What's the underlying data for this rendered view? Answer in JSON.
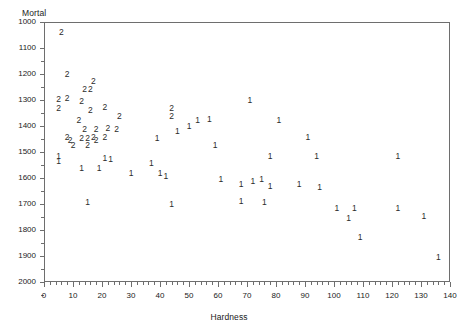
{
  "chart_data": {
    "type": "scatter",
    "title": "",
    "xlabel": "Hardness",
    "ylabel": "Mortal",
    "xlim": [
      0,
      140
    ],
    "ylim": [
      1000,
      2000
    ],
    "xticks": [
      0,
      10,
      20,
      30,
      40,
      50,
      60,
      70,
      80,
      90,
      100,
      110,
      120,
      130,
      140
    ],
    "yticks": [
      1000,
      1100,
      1200,
      1300,
      1400,
      1500,
      1600,
      1700,
      1800,
      1900,
      2000
    ],
    "grid": false,
    "legend": "none",
    "point_marker_mode": "group-digit-label",
    "series": [
      {
        "name": "2",
        "label": "2",
        "points": [
          [
            6,
            1960
          ],
          [
            8,
            1800
          ],
          [
            14,
            1742
          ],
          [
            17,
            1772
          ],
          [
            16,
            1742
          ],
          [
            5,
            1702
          ],
          [
            8,
            1709
          ],
          [
            13,
            1696
          ],
          [
            5,
            1668
          ],
          [
            16,
            1660
          ],
          [
            21,
            1673
          ],
          [
            44,
            1668
          ],
          [
            44,
            1640
          ],
          [
            12,
            1625
          ],
          [
            26,
            1640
          ],
          [
            14,
            1587
          ],
          [
            18,
            1589
          ],
          [
            22,
            1591
          ],
          [
            25,
            1587
          ],
          [
            8,
            1558
          ],
          [
            13,
            1555
          ],
          [
            17,
            1559
          ],
          [
            21,
            1558
          ],
          [
            9,
            1547
          ],
          [
            15,
            1555
          ],
          [
            18,
            1546
          ],
          [
            10,
            1527
          ],
          [
            15,
            1527
          ]
        ]
      },
      {
        "name": "1",
        "label": "1",
        "points": [
          [
            71,
            1700
          ],
          [
            50,
            1600
          ],
          [
            53,
            1625
          ],
          [
            57,
            1627
          ],
          [
            46,
            1580
          ],
          [
            81,
            1625
          ],
          [
            91,
            1558
          ],
          [
            122,
            1486
          ],
          [
            39,
            1555
          ],
          [
            59,
            1527
          ],
          [
            78,
            1485
          ],
          [
            94,
            1485
          ],
          [
            37,
            1456
          ],
          [
            21,
            1477
          ],
          [
            23,
            1475
          ],
          [
            5,
            1486
          ],
          [
            5,
            1466
          ],
          [
            19,
            1440
          ],
          [
            13,
            1440
          ],
          [
            30,
            1420
          ],
          [
            40,
            1420
          ],
          [
            42,
            1406
          ],
          [
            61,
            1395
          ],
          [
            68,
            1378
          ],
          [
            72,
            1387
          ],
          [
            75,
            1396
          ],
          [
            78,
            1369
          ],
          [
            88,
            1378
          ],
          [
            95,
            1365
          ],
          [
            15,
            1308
          ],
          [
            44,
            1300
          ],
          [
            68,
            1310
          ],
          [
            76,
            1306
          ],
          [
            101,
            1286
          ],
          [
            107,
            1285
          ],
          [
            122,
            1286
          ],
          [
            131,
            1254
          ],
          [
            105,
            1247
          ],
          [
            109,
            1175
          ],
          [
            136,
            1096
          ]
        ]
      }
    ]
  },
  "axes": {
    "y_title": "Mortal",
    "x_title": "Hardness",
    "y_tick_labels": [
      "2000",
      "1900",
      "1800",
      "1700",
      "1600",
      "1500",
      "1400",
      "1300",
      "1200",
      "1100",
      "1000"
    ],
    "x_tick_labels": [
      "0",
      "10",
      "20",
      "30",
      "40",
      "50",
      "60",
      "70",
      "80",
      "90",
      "100",
      "110",
      "120",
      "130",
      "140"
    ]
  },
  "colors": {
    "frame": "#6e6e6e",
    "text": "#1a1a1a",
    "point": "#2b2b2b",
    "background": "#ffffff"
  }
}
